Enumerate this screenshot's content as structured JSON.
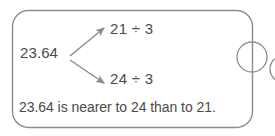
{
  "figure": {
    "type": "math-branching-diagram",
    "background_color": "#ffffff",
    "stroke_color": "#8c8c8c",
    "text_color": "#4a4a4a",
    "panel": {
      "shape": "rounded-rectangle",
      "corner_radius": 16
    },
    "source_node": {
      "label": "23.64"
    },
    "branches": [
      {
        "id": "upper",
        "label": "21 ÷ 3",
        "direction": "up-right",
        "arrowhead": "filled"
      },
      {
        "id": "lower",
        "label": "24 ÷ 3",
        "direction": "down-right",
        "arrowhead": "filled"
      }
    ],
    "conclusion": "23.64 is nearer to 24 than to 21.",
    "edge_decorations": [
      {
        "name": "circle-on-right-border",
        "shape": "circle",
        "cx": 252,
        "cy": 57,
        "r": 15
      },
      {
        "name": "clipped-circle-at-image-edge",
        "shape": "circle",
        "cx": 283,
        "cy": 69,
        "r": 13
      }
    ]
  }
}
